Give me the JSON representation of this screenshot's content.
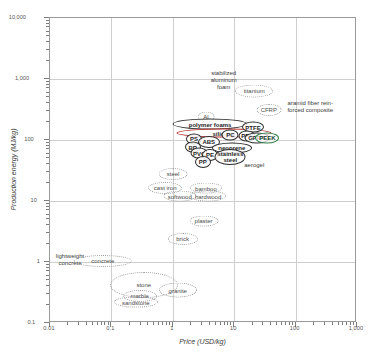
{
  "chart_data": {
    "type": "scatter",
    "title": "",
    "xlabel": "Price (USD/kg)",
    "ylabel": "Production energy (MJ/kg)",
    "xscale": "log",
    "yscale": "log",
    "xlim": [
      0.01,
      1000
    ],
    "ylim": [
      0.1,
      10000
    ],
    "grid": true,
    "legend": "none",
    "xticks": [
      "0.01",
      "0.1",
      "1",
      "10",
      "100",
      "1,000"
    ],
    "yticks": [
      "0.1",
      "1",
      "10",
      "100",
      "1,000",
      "10,000"
    ],
    "bubbles": [
      {
        "label": "stabilized\naluminum\nfoam",
        "x": 7.0,
        "y": 900,
        "w": 40,
        "h": 30,
        "style": "text"
      },
      {
        "label": "titanium",
        "x": 22.0,
        "y": 620,
        "w": 38,
        "h": 13,
        "style": "dotted"
      },
      {
        "label": "aramid fiber rein-\nforced composite",
        "x": 180.0,
        "y": 330,
        "w": 64,
        "h": 20,
        "style": "text"
      },
      {
        "label": "CFRP",
        "x": 38.0,
        "y": 300,
        "w": 25,
        "h": 12,
        "style": "dotted"
      },
      {
        "label": "Al",
        "x": 3.6,
        "y": 230,
        "w": 17,
        "h": 11,
        "style": "dotted"
      },
      {
        "label": "polymer foams",
        "x": 4.2,
        "y": 175,
        "w": 75,
        "h": 11,
        "style": "solid"
      },
      {
        "label": "silicone",
        "x": 7.0,
        "y": 125,
        "w": 95,
        "h": 9,
        "style": "red"
      },
      {
        "label": "PTFE",
        "x": 21.0,
        "y": 155,
        "w": 22,
        "h": 11,
        "style": "solid"
      },
      {
        "label": "PC",
        "x": 9.0,
        "y": 118,
        "w": 17,
        "h": 11,
        "style": "solid"
      },
      {
        "label": "PPS",
        "x": 17.0,
        "y": 112,
        "w": 17,
        "h": 11,
        "style": "solid"
      },
      {
        "label": "GFRP",
        "x": 24.0,
        "y": 105,
        "w": 25,
        "h": 11,
        "style": "solid"
      },
      {
        "label": "PEEK",
        "x": 36.0,
        "y": 105,
        "w": 24,
        "h": 11,
        "style": "green"
      },
      {
        "label": "PS",
        "x": 2.3,
        "y": 100,
        "w": 16,
        "h": 11,
        "style": "solid"
      },
      {
        "label": "ABS",
        "x": 4.0,
        "y": 88,
        "w": 22,
        "h": 12,
        "style": "solid"
      },
      {
        "label": "BR",
        "x": 2.2,
        "y": 73,
        "w": 16,
        "h": 11,
        "style": "solid"
      },
      {
        "label": "neoprene",
        "x": 9.5,
        "y": 72,
        "w": 40,
        "h": 11,
        "style": "solid"
      },
      {
        "label": "PVC",
        "x": 2.8,
        "y": 58,
        "w": 17,
        "h": 11,
        "style": "solid"
      },
      {
        "label": "PE",
        "x": 4.2,
        "y": 55,
        "w": 16,
        "h": 12,
        "style": "solid"
      },
      {
        "label": "stainless\nsteel",
        "x": 9.0,
        "y": 50,
        "w": 31,
        "h": 16,
        "style": "solid"
      },
      {
        "label": "PP",
        "x": 3.2,
        "y": 42,
        "w": 16,
        "h": 12,
        "style": "solid"
      },
      {
        "label": "aerogel",
        "x": 22.0,
        "y": 38,
        "w": 26,
        "h": 11,
        "style": "text"
      },
      {
        "label": "steel",
        "x": 1.05,
        "y": 27,
        "w": 29,
        "h": 12,
        "style": "dotted"
      },
      {
        "label": "cast iron",
        "x": 0.78,
        "y": 15.5,
        "w": 34,
        "h": 12,
        "style": "dotted"
      },
      {
        "label": "bamboo",
        "x": 3.6,
        "y": 15.5,
        "w": 32,
        "h": 11,
        "style": "dotted"
      },
      {
        "label": "softwood",
        "x": 1.35,
        "y": 11.5,
        "w": 33,
        "h": 11,
        "style": "dotted"
      },
      {
        "label": "hardwood",
        "x": 3.9,
        "y": 11.5,
        "w": 36,
        "h": 11,
        "style": "dotted"
      },
      {
        "label": "plaster",
        "x": 3.3,
        "y": 4.6,
        "w": 29,
        "h": 11,
        "style": "dotted"
      },
      {
        "label": "brick",
        "x": 1.5,
        "y": 2.3,
        "w": 30,
        "h": 12,
        "style": "dotted"
      },
      {
        "label": "lightweight\nconcrete",
        "x": 0.022,
        "y": 1.05,
        "w": 36,
        "h": 16,
        "style": "text"
      },
      {
        "label": "concrete",
        "x": 0.075,
        "y": 1.0,
        "w": 58,
        "h": 12,
        "style": "dotted"
      },
      {
        "label": "stone",
        "x": 0.35,
        "y": 0.4,
        "w": 68,
        "h": 26,
        "style": "dotted"
      },
      {
        "label": "granite",
        "x": 1.25,
        "y": 0.33,
        "w": 38,
        "h": 15,
        "style": "dotted"
      },
      {
        "label": "marble",
        "x": 0.3,
        "y": 0.27,
        "w": 34,
        "h": 12,
        "style": "dotted"
      },
      {
        "label": "sandstone",
        "x": 0.26,
        "y": 0.21,
        "w": 44,
        "h": 11,
        "style": "dotted"
      }
    ]
  }
}
